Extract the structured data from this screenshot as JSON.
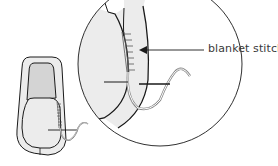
{
  "diagram": {
    "callout_label": "blanket stitch",
    "colors": {
      "outline": "#1a1a1a",
      "light_fill": "#ececec",
      "mid_fill": "#d4d4d4",
      "background": "#ffffff",
      "label_text": "#3a3a3a"
    },
    "parts": [
      {
        "name": "small-shoe-overview"
      },
      {
        "name": "magnified-detail-circle"
      },
      {
        "name": "needle-and-thread"
      }
    ]
  }
}
